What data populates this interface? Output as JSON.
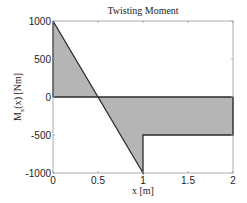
{
  "chart_data": {
    "type": "area",
    "title": "Twisting Moment",
    "xlabel": "x [m]",
    "ylabel": "M_x(x) [Nm]",
    "ylabel_main": "M",
    "ylabel_sub": "x",
    "ylabel_rest": "(x) [Nm]",
    "xlim": [
      0,
      2
    ],
    "ylim": [
      -1000,
      1000
    ],
    "xticks": [
      0,
      0.5,
      1,
      1.5,
      2
    ],
    "xtick_labels": [
      "0",
      "0.5",
      "1",
      "1.5",
      "2"
    ],
    "yticks": [
      1000,
      500,
      0,
      -500,
      -1000
    ],
    "ytick_labels": [
      "1000",
      "500",
      "0",
      "-500",
      "-1000"
    ],
    "grid": false,
    "legend": null,
    "series": [
      {
        "name": "M_x(x)",
        "x": [
          0,
          1,
          1,
          2
        ],
        "y": [
          1000,
          -1000,
          -500,
          -500
        ],
        "fill_to_zero": true
      }
    ],
    "colors": {
      "fill": "#b5b5b5",
      "line": "#2a2a2a",
      "axes": "#9a9a9a"
    }
  }
}
